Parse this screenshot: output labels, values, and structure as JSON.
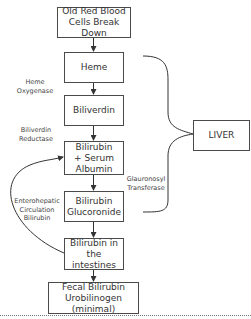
{
  "diagram": {
    "nodes": [
      {
        "id": "old-rbc",
        "text": "Old Red Blood\nCells Break Down"
      },
      {
        "id": "heme",
        "text": "Heme"
      },
      {
        "id": "biliverdin",
        "text": "Biliverdin"
      },
      {
        "id": "bilirubin-albumin",
        "text": "Bilirubin\n+ Serum\nAlbumin"
      },
      {
        "id": "bilirubin-glucoronide",
        "text": "Bilirubin\nGlucoronide"
      },
      {
        "id": "bilirubin-intestines",
        "text": "Bilirubin in\nthe intestines"
      },
      {
        "id": "fecal",
        "text": "Fecal Bilirubin\nUrobilinogen (minimal)"
      },
      {
        "id": "liver",
        "text": "LIVER"
      }
    ],
    "labels": {
      "heme_oxygenase": "Heme\nOxygenase",
      "biliverdin_reductase": "Biliverdin\nReductase",
      "glucuronosyl_transferase": "Glauronosyl\nTransferase",
      "enterohepatic": "Enterohepatic\nCirculation\nBilirubin"
    },
    "edges": [
      [
        "old-rbc",
        "heme"
      ],
      [
        "heme",
        "biliverdin"
      ],
      [
        "biliverdin",
        "bilirubin-albumin"
      ],
      [
        "bilirubin-albumin",
        "bilirubin-glucoronide"
      ],
      [
        "bilirubin-glucoronide",
        "bilirubin-intestines"
      ],
      [
        "bilirubin-intestines",
        "fecal"
      ],
      [
        "bilirubin-intestines",
        "bilirubin-albumin"
      ]
    ],
    "colors": {
      "stroke": "#4a4a4a",
      "text": "#333333"
    }
  }
}
